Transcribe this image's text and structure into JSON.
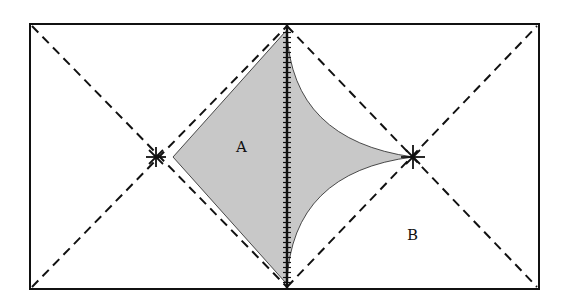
{
  "diagram": {
    "labels": {
      "region_a": "A",
      "region_b": "B"
    },
    "colors": {
      "stroke": "#111111",
      "shade": "#c8c8c8",
      "background": "#ffffff"
    },
    "frame": {
      "x1": 30,
      "y1": 24,
      "x2": 539,
      "y2": 289
    },
    "center_line_x": 287,
    "points": {
      "left_star": [
        156,
        157
      ],
      "right_star": [
        413,
        157
      ]
    }
  }
}
